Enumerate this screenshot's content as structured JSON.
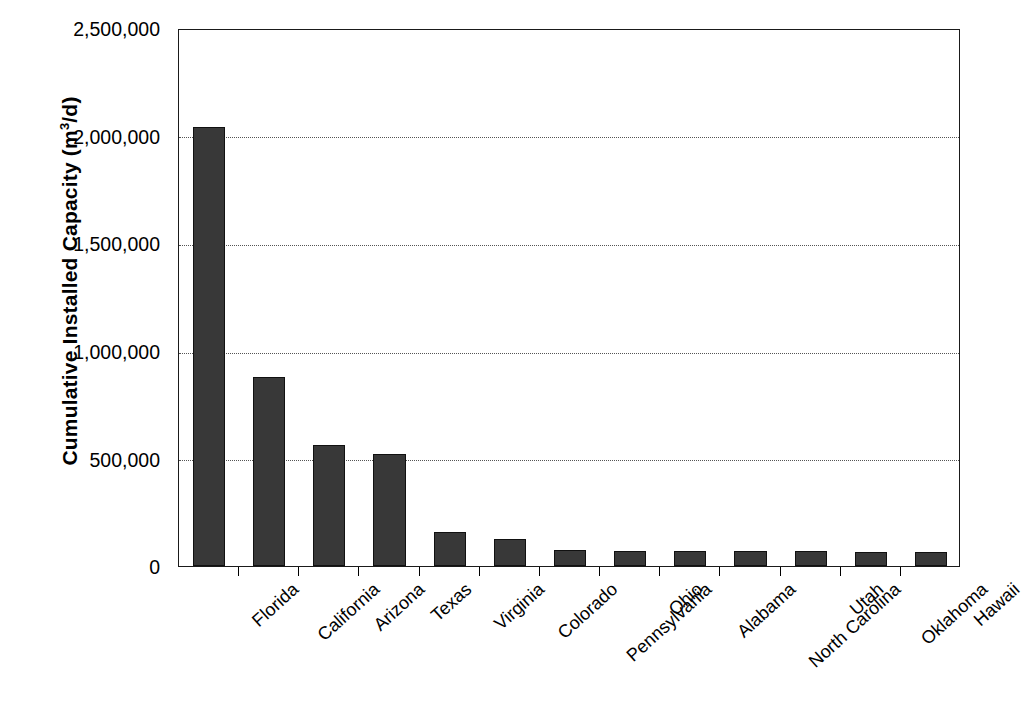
{
  "chart_data": {
    "type": "bar",
    "title": "",
    "xlabel": "",
    "ylabel": "Cumulative Installed Capacity (m3/d)",
    "ylabel_parts": {
      "prefix": "Cumulative Installed Capacity (m",
      "exponent": "3",
      "suffix": "/d)"
    },
    "categories": [
      "Florida",
      "California",
      "Arizona",
      "Texas",
      "Virginia",
      "Colorado",
      "Pennsylvania",
      "Ohio",
      "Alabama",
      "North Carolina",
      "Utah",
      "Oklahoma",
      "Hawaii"
    ],
    "values": [
      2040000,
      878000,
      562000,
      522000,
      160000,
      124000,
      76000,
      72000,
      70000,
      70000,
      68000,
      66000,
      66000
    ],
    "ylim": [
      0,
      2500000
    ],
    "ytick_values": [
      0,
      500000,
      1000000,
      1500000,
      2000000,
      2500000
    ],
    "ytick_labels": [
      "0",
      "500,000",
      "1,000,000",
      "1,500,000",
      "2,000,000",
      "2,500,000"
    ],
    "grid": true,
    "grid_style": "dotted",
    "legend": "none",
    "bar_color": "#383838",
    "bar_edge_color": "#111111",
    "axis_color": "#1a1a1a",
    "background_color": "#ffffff"
  }
}
